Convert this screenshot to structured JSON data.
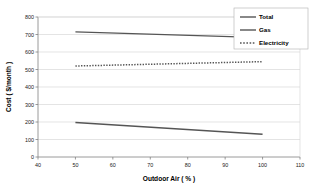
{
  "chart_data": {
    "type": "line",
    "title": "",
    "xlabel": "Outdoor Air ( % )",
    "ylabel": "Cost ( $/month )",
    "xlim": [
      40,
      110
    ],
    "ylim": [
      0,
      800
    ],
    "xticks": [
      40,
      50,
      60,
      70,
      80,
      90,
      100,
      110
    ],
    "yticks": [
      0,
      100,
      200,
      300,
      400,
      500,
      600,
      700,
      800
    ],
    "xticklabels": [
      "40",
      "50",
      "60",
      "70",
      "80",
      "90",
      "100",
      "110"
    ],
    "yticklabels": [
      "0",
      "100",
      "200",
      "300",
      "400",
      "500",
      "600",
      "700",
      "800"
    ],
    "grid": "horizontal",
    "legend_position": "upper right",
    "x": [
      50,
      100
    ],
    "series": [
      {
        "name": "Total",
        "values": [
          715,
          682
        ],
        "style": "solid",
        "color": "#555555"
      },
      {
        "name": "Gas",
        "values": [
          197,
          130
        ],
        "style": "solid",
        "color": "#555555"
      },
      {
        "name": "Electricity",
        "values": [
          520,
          545
        ],
        "style": "dotted",
        "color": "#555555"
      }
    ]
  },
  "axes": {
    "x_title": "Outdoor Air ( % )",
    "y_title": "Cost ( $/month )",
    "x_labels": [
      "40",
      "50",
      "60",
      "70",
      "80",
      "90",
      "100",
      "110"
    ],
    "y_labels": [
      "0",
      "100",
      "200",
      "300",
      "400",
      "500",
      "600",
      "700",
      "800"
    ]
  },
  "legend": {
    "items": [
      {
        "label": "Total",
        "style": "solid"
      },
      {
        "label": "Gas",
        "style": "solid"
      },
      {
        "label": "Electricity",
        "style": "dotted"
      }
    ]
  },
  "colors": {
    "line": "#555555",
    "grid": "#d9d9d9",
    "axis": "#808080",
    "text": "#1a1a1a",
    "background": "#ffffff"
  }
}
